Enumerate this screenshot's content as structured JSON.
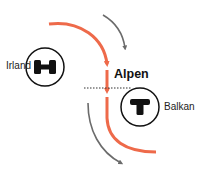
{
  "diagram": {
    "labels": {
      "irland": "Irland",
      "balkan": "Balkan",
      "alpen": "Alpen"
    },
    "high_pressure": {
      "symbol": "H",
      "name": "high-pressure-system"
    },
    "low_pressure": {
      "symbol": "T",
      "name": "low-pressure-system"
    },
    "colors": {
      "main_flow": "#ee6a4a",
      "secondary_flow": "#6b6b6b",
      "circle_stroke": "#111111",
      "dotted_line": "#333333"
    }
  }
}
